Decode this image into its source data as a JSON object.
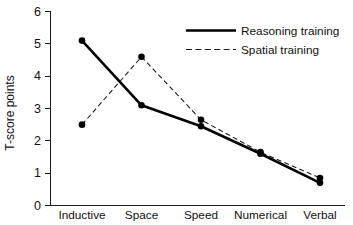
{
  "chart_data": {
    "type": "line",
    "title": "",
    "subtitle": "",
    "xlabel": "",
    "ylabel": "T-score points",
    "categories": [
      "Inductive",
      "Space",
      "Speed",
      "Numerical",
      "Verbal"
    ],
    "ylim": [
      0,
      6
    ],
    "yticks": [
      0,
      1,
      2,
      3,
      4,
      5,
      6
    ],
    "ytick_labels": [
      "0",
      "1",
      "2",
      "3",
      "4",
      "5",
      "6"
    ],
    "grid": false,
    "legend_position": "top-right",
    "series": [
      {
        "name": "Reasoning training",
        "style": "solid",
        "values": [
          5.1,
          3.1,
          2.45,
          1.6,
          0.7
        ]
      },
      {
        "name": "Spatial training",
        "style": "dashed",
        "values": [
          2.5,
          4.6,
          2.65,
          1.65,
          0.85
        ]
      }
    ],
    "legend": [
      {
        "label": "Reasoning training",
        "style": "solid"
      },
      {
        "label": "Spatial training",
        "style": "dashed"
      }
    ],
    "colors": {
      "axis": "#1a1a1a",
      "reasoning": "#000000",
      "spatial": "#1a1a1a",
      "background": "#ffffff"
    }
  }
}
